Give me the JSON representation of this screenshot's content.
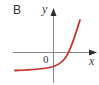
{
  "figure": {
    "panel_label": "B",
    "x_axis_label": "x",
    "y_axis_label": "y",
    "origin_label": "0",
    "curve_color": "#c8322a",
    "axis_color": "#7a7a7a",
    "curve_description": "Exponential growth curve shifted down: horizontal asymptote below the x-axis, negative y-intercept, crosses x-axis at positive x, rising steeply to the upper right"
  }
}
